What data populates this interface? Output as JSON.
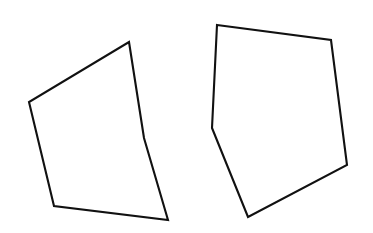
{
  "canvas": {
    "width": 373,
    "height": 233,
    "background_color": "#ffffff"
  },
  "figure": {
    "title": "",
    "stroke_color": "#111111",
    "stroke_width": 2.1,
    "fill": "none",
    "shapes": [
      {
        "name": "left-pentagon",
        "sides": 5,
        "points": "129,42 144,138 168,220 54,206 29,102",
        "vertices": [
          {
            "label": "top",
            "x": 129,
            "y": 42
          },
          {
            "label": "right",
            "x": 144,
            "y": 138
          },
          {
            "label": "bottom-right",
            "x": 168,
            "y": 220
          },
          {
            "label": "bottom-left",
            "x": 54,
            "y": 206
          },
          {
            "label": "left",
            "x": 29,
            "y": 102
          }
        ]
      },
      {
        "name": "right-pentagon",
        "sides": 5,
        "points": "217,25 331,40 347,165 248,217 212,128",
        "vertices": [
          {
            "label": "top-left",
            "x": 217,
            "y": 25
          },
          {
            "label": "top-right",
            "x": 331,
            "y": 40
          },
          {
            "label": "right",
            "x": 347,
            "y": 165
          },
          {
            "label": "bottom",
            "x": 248,
            "y": 217
          },
          {
            "label": "left",
            "x": 212,
            "y": 128
          }
        ]
      }
    ],
    "intersections": [
      {
        "name": "upper-crossing",
        "x": 177,
        "y": 91
      },
      {
        "name": "lower-crossing",
        "x": 189,
        "y": 173
      }
    ]
  }
}
